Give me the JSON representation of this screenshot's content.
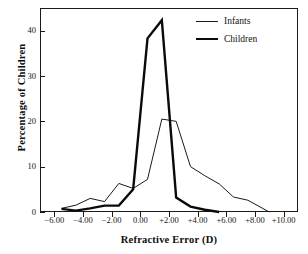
{
  "chart_data": {
    "type": "line",
    "title": "",
    "subtitle": "",
    "xlabel": "Refractive Error (D)",
    "ylabel": "Percentage of Children",
    "xlim": [
      -7.0,
      11.0
    ],
    "ylim": [
      0,
      45
    ],
    "grid": false,
    "legend_position": "top-right",
    "xticks": [
      -6,
      -4,
      -2,
      0,
      2,
      4,
      6,
      8,
      10
    ],
    "xticklabels": [
      "−6.00",
      "−4.00",
      "−2.00",
      "0.00",
      "+2.00",
      "+4.00",
      "+6.00",
      "+8.00",
      "+10.00"
    ],
    "yticks": [
      0,
      10,
      20,
      30,
      40
    ],
    "yticklabels": [
      "0",
      "10",
      "20",
      "30",
      "40"
    ],
    "series": [
      {
        "name": "Infants",
        "style": "thin",
        "color": "#1a1a1a",
        "width": 1.0,
        "x": [
          -5.5,
          -4.5,
          -3.5,
          -2.5,
          -1.5,
          -0.5,
          0.5,
          1.5,
          2.5,
          3.5,
          4.5,
          5.5,
          6.5,
          7.5,
          9.0
        ],
        "y": [
          0.8,
          1.5,
          3.0,
          2.3,
          6.3,
          5.2,
          7.2,
          20.5,
          20.0,
          10.0,
          8.0,
          6.2,
          3.3,
          2.6,
          0.0
        ]
      },
      {
        "name": "Children",
        "style": "thick",
        "color": "#0a0a0a",
        "width": 2.4,
        "x": [
          -5.5,
          -4.5,
          -3.5,
          -2.5,
          -1.5,
          -0.5,
          0.5,
          1.5,
          2.5,
          3.5,
          4.5,
          5.5
        ],
        "y": [
          0.7,
          0.3,
          0.8,
          1.4,
          1.4,
          5.0,
          38.3,
          42.3,
          3.2,
          1.2,
          0.5,
          0.0
        ]
      }
    ]
  },
  "legend": {
    "items": [
      {
        "label": "Infants",
        "style": "thin"
      },
      {
        "label": "Children",
        "style": "thick"
      }
    ]
  },
  "axes": {
    "x_title": "Refractive Error (D)",
    "y_title": "Percentage of Children"
  }
}
